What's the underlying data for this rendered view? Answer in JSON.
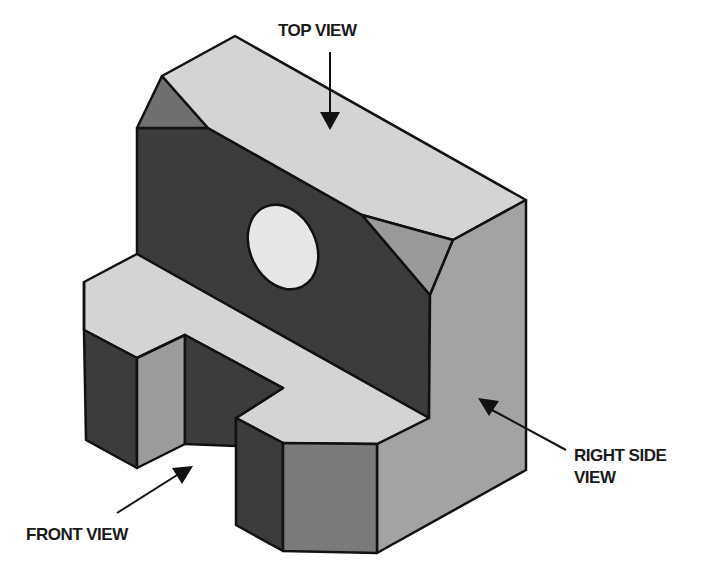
{
  "figure": {
    "colors": {
      "top_faces": "#d4d4d4",
      "front_faces": "#3c3c3c",
      "right_faces": "#a3a3a3",
      "front_chamfer": "#7a7a7a",
      "left_chamfer": "#707070",
      "right_chamfer": "#9a9a9a",
      "slot_side": "#9c9c9c",
      "hole_fill": "#e6e6e6",
      "outline": "#111111"
    }
  },
  "labels": {
    "top_view": "TOP VIEW",
    "front_view": "FRONT VIEW",
    "right_side_view_line1": "RIGHT SIDE",
    "right_side_view_line2": "VIEW"
  },
  "arrows": [
    {
      "name": "top-view-arrow",
      "target": "top face"
    },
    {
      "name": "front-view-arrow",
      "target": "front face"
    },
    {
      "name": "right-side-view-arrow",
      "target": "right side face"
    }
  ]
}
